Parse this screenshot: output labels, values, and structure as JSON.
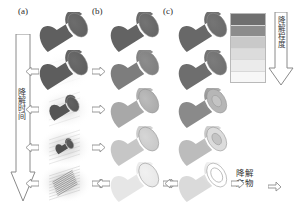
{
  "figure": {
    "title_panels": [
      {
        "id": "a",
        "label": "(a)"
      },
      {
        "id": "b",
        "label": "(b)"
      },
      {
        "id": "c",
        "label": "(c)"
      }
    ],
    "time_axis": {
      "label": "降解时间",
      "direction": "downward",
      "icon": "down-arrow-icon"
    },
    "legend": {
      "label": "降解程度",
      "direction": "downward",
      "icon": "down-arrow-icon",
      "bands": [
        {
          "index": 1,
          "color": "#6f6f6f"
        },
        {
          "index": 2,
          "color": "#8c8c8c"
        },
        {
          "index": 3,
          "color": "#c9c9c9"
        },
        {
          "index": 4,
          "color": "#dcdcdc"
        },
        {
          "index": 5,
          "color": "#ebebeb"
        },
        {
          "index": 6,
          "color": "#f7f7f7"
        }
      ]
    },
    "products": {
      "line1": "降解",
      "line2": "产物",
      "icon": "right-arrow-icon"
    },
    "columns": [
      {
        "id": "a",
        "mechanism": "bulk-degradation-with-fibrous-core",
        "stages": [
          {
            "step": 1,
            "body_color": "#5f5f5f",
            "cap_color": "#6d6d6d",
            "halo": 0,
            "core": "solid",
            "scale": 1.0,
            "arrows": [
              "none"
            ]
          },
          {
            "step": 2,
            "body_color": "#5d5d5d",
            "cap_color": "#6b6b6b",
            "halo": 0.18,
            "core": "solid",
            "scale": 1.0,
            "arrows": [
              "left",
              "right"
            ]
          },
          {
            "step": 3,
            "body_color": "#555555",
            "cap_color": "#626262",
            "halo": 0.5,
            "core": "shrunk",
            "scale": 0.62,
            "arrows": [
              "left",
              "right"
            ]
          },
          {
            "step": 4,
            "body_color": "#4f4f4f",
            "cap_color": "#5c5c5c",
            "halo": 0.72,
            "core": "shrunk",
            "scale": 0.38,
            "arrows": [
              "left",
              "right"
            ]
          },
          {
            "step": 5,
            "body_color": "#9a9a9a",
            "cap_color": "#a5a5a5",
            "halo": 0.9,
            "core": "fibrous",
            "scale": 0.2,
            "arrows": [
              "left",
              "right"
            ]
          }
        ]
      },
      {
        "id": "b",
        "mechanism": "uniform-bulk-erosion-fading",
        "stages": [
          {
            "step": 1,
            "body_color": "#636363",
            "cap_color": "#747474",
            "halo": 0,
            "core": "solid",
            "scale": 1.0,
            "arrows": [
              "none"
            ]
          },
          {
            "step": 2,
            "body_color": "#7d7d7d",
            "cap_color": "#8d8d8d",
            "halo": 0,
            "core": "solid",
            "scale": 1.0,
            "arrows": [
              "none"
            ]
          },
          {
            "step": 3,
            "body_color": "#a8a8a8",
            "cap_color": "#bcbcbc",
            "halo": 0,
            "core": "solid",
            "scale": 1.0,
            "arrows": [
              "none"
            ]
          },
          {
            "step": 4,
            "body_color": "#c6c6c6",
            "cap_color": "#d6d6d6",
            "halo": 0,
            "core": "solid",
            "scale": 1.0,
            "arrows": [
              "none"
            ]
          },
          {
            "step": 5,
            "body_color": "#e6e6e6",
            "cap_color": "#f1f1f1",
            "halo": 0,
            "core": "solid",
            "scale": 1.0,
            "arrows": [
              "left",
              "right"
            ]
          }
        ]
      },
      {
        "id": "c",
        "mechanism": "surface-erosion-to-hollow-tube",
        "stages": [
          {
            "step": 1,
            "body_color": "#686868",
            "cap_color": "#757575",
            "halo": 0,
            "core": "solid",
            "scale": 1.0,
            "arrows": [
              "none"
            ]
          },
          {
            "step": 2,
            "body_color": "#6e6e6e",
            "cap_color": "#7c7c7c",
            "halo": 0,
            "core": "solid",
            "scale": 1.0,
            "arrows": [
              "none"
            ]
          },
          {
            "step": 3,
            "body_color": "#8a8a8a",
            "cap_color": "#b6b6b6",
            "halo": 0,
            "core": "ring",
            "scale": 1.0,
            "arrows": [
              "none"
            ]
          },
          {
            "step": 4,
            "body_color": "#bcbcbc",
            "cap_color": "#dcdcdc",
            "halo": 0,
            "core": "ring",
            "scale": 1.0,
            "arrows": [
              "none"
            ]
          },
          {
            "step": 5,
            "body_color": "#dadada",
            "cap_color": "#ffffff",
            "halo": 0,
            "core": "hollow",
            "scale": 1.0,
            "arrows": [
              "left",
              "right"
            ]
          }
        ]
      }
    ]
  }
}
